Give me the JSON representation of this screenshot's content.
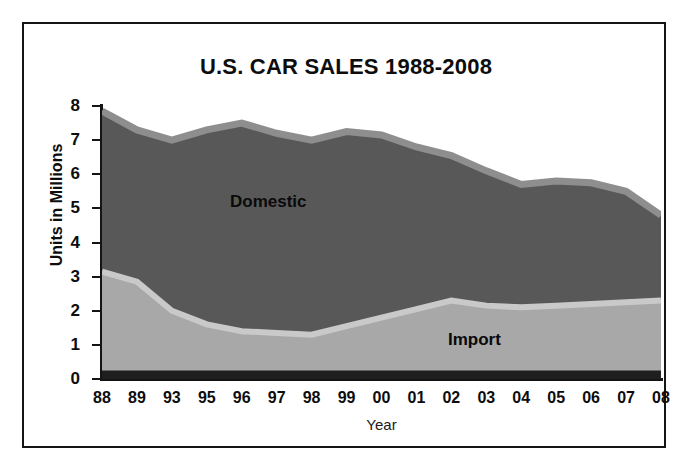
{
  "chart_data": {
    "type": "area",
    "title": "U.S. CAR SALES 1988-2008",
    "xlabel": "Year",
    "ylabel": "Units in Millions",
    "stacked": true,
    "grid": false,
    "legend_position": "inline-annotations",
    "ylim": [
      0,
      8
    ],
    "ytick_labels": [
      "8",
      "7",
      "6",
      "5",
      "4",
      "3",
      "2",
      "1",
      "0"
    ],
    "yticks": [
      8,
      7,
      6,
      5,
      4,
      3,
      2,
      1,
      0
    ],
    "categories": [
      "88",
      "89",
      "93",
      "95",
      "96",
      "97",
      "98",
      "99",
      "00",
      "01",
      "02",
      "03",
      "04",
      "05",
      "06",
      "07",
      "08"
    ],
    "series": [
      {
        "name": "Import",
        "color": "#a8a8a8",
        "values": [
          3.15,
          2.85,
          2.0,
          1.6,
          1.4,
          1.35,
          1.3,
          1.55,
          1.8,
          2.05,
          2.3,
          2.15,
          2.1,
          2.15,
          2.2,
          2.25,
          2.3
        ]
      },
      {
        "name": "Domestic",
        "color": "#585858",
        "values": [
          4.7,
          4.45,
          5.0,
          5.7,
          6.1,
          5.85,
          5.7,
          5.7,
          5.35,
          4.75,
          4.25,
          3.95,
          3.6,
          3.65,
          3.55,
          3.25,
          2.5
        ]
      }
    ],
    "totals": [
      7.85,
      7.3,
      7.0,
      7.3,
      7.5,
      7.2,
      7.0,
      7.25,
      7.15,
      6.8,
      6.55,
      6.1,
      5.7,
      5.8,
      5.75,
      5.5,
      4.8
    ],
    "annotations": [
      {
        "text": "Domestic",
        "series": "Domestic"
      },
      {
        "text": "Import",
        "series": "Import"
      }
    ],
    "colors": {
      "domestic_fill": "#585858",
      "import_fill": "#a8a8a8",
      "top_band": "#8e8e8e",
      "divider_band": "#c9c9c9",
      "baseline_band": "#1f1f1f",
      "axis": "#141414",
      "text": "#0d0d0d",
      "background": "#ffffff"
    }
  }
}
